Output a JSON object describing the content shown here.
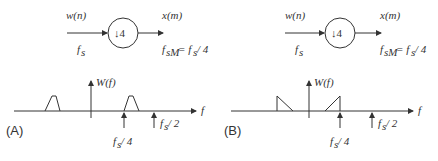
{
  "panels": [
    {
      "id": "A",
      "label": "(A)",
      "block": {
        "input_signal": "w(n)",
        "input_rate": "f",
        "input_rate_sub": "s",
        "operator": "↓4",
        "output_signal": "x(m)",
        "output_rate_lhs": "f",
        "output_rate_lhs_sub": "sM",
        "output_rate_rhs": "= f",
        "output_rate_rhs_sub": "s",
        "output_rate_tail": "/ 4"
      },
      "spectrum": {
        "y_label": "W(f)",
        "x_label": "f",
        "shape": "trapezoid",
        "marker_1": "f",
        "marker_1_sub": "s",
        "marker_1_tail": "/ 4",
        "marker_2": "f",
        "marker_2_sub": "s",
        "marker_2_tail": "/ 2"
      }
    },
    {
      "id": "B",
      "label": "(B)",
      "block": {
        "input_signal": "w(n)",
        "input_rate": "f",
        "input_rate_sub": "s",
        "operator": "↓4",
        "output_signal": "x(m)",
        "output_rate_lhs": "f",
        "output_rate_lhs_sub": "sM",
        "output_rate_rhs": "= f",
        "output_rate_rhs_sub": "s",
        "output_rate_tail": "/ 4"
      },
      "spectrum": {
        "y_label": "W(f)",
        "x_label": "f",
        "shape": "triangle",
        "marker_1": "f",
        "marker_1_sub": "s",
        "marker_1_tail": "/ 4",
        "marker_2": "f",
        "marker_2_sub": "s",
        "marker_2_tail": "/ 2"
      }
    }
  ]
}
